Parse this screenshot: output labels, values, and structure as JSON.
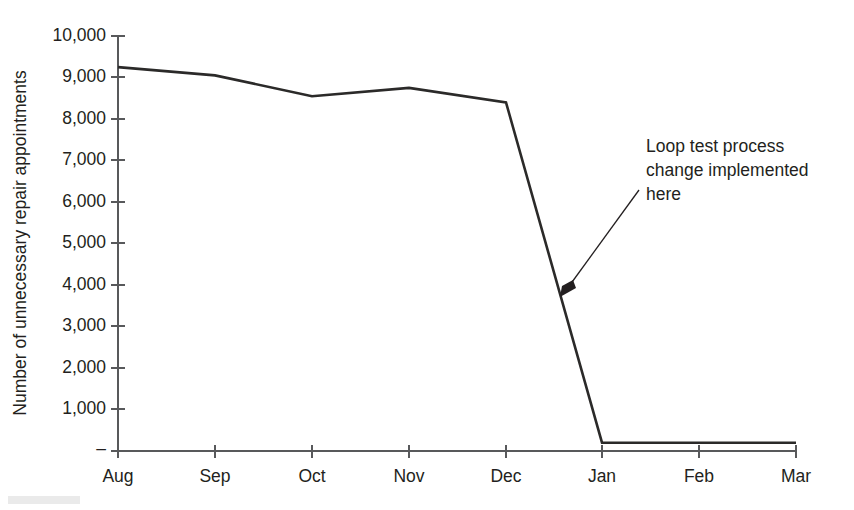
{
  "chart_data": {
    "type": "line",
    "title": "",
    "xlabel": "",
    "ylabel": "Number of unnecessary repair appointments",
    "categories": [
      "Aug",
      "Sep",
      "Oct",
      "Nov",
      "Dec",
      "Jan",
      "Feb",
      "Mar"
    ],
    "values": [
      9250,
      9050,
      8550,
      8750,
      8400,
      200,
      200,
      200
    ],
    "series": [
      {
        "name": "Unnecessary repair appointments",
        "values": [
          9250,
          9050,
          8550,
          8750,
          8400,
          200,
          200,
          200
        ],
        "color": "#2b2a29"
      }
    ],
    "ylim": [
      0,
      10000
    ],
    "ytick_values": [
      0,
      1000,
      2000,
      3000,
      4000,
      5000,
      6000,
      7000,
      8000,
      9000,
      10000
    ],
    "ytick_labels": [
      "–",
      "1,000",
      "2,000",
      "3,000",
      "4,000",
      "5,000",
      "6,000",
      "7,000",
      "8,000",
      "9,000",
      "10,000"
    ],
    "grid": false,
    "legend": false,
    "legend_position": "none",
    "annotations": [
      {
        "text_lines": [
          "Loop test process",
          "change implemented",
          "here"
        ],
        "text_x": 646,
        "text_y": 152,
        "arrow_from_x": 639,
        "arrow_from_y": 190,
        "arrow_to_x": 562,
        "arrow_to_y": 296,
        "points_to_category": "between Dec and Jan"
      }
    ],
    "colors": {
      "series": "#2b2a29",
      "axis": "#58595b",
      "text": "#231f20",
      "background": "#ffffff"
    }
  },
  "axes": {
    "x_positions": [
      118,
      215,
      312,
      409,
      506,
      602,
      699,
      796
    ],
    "y_top_px": 36,
    "y_bottom_px": 451,
    "x_left_px": 118,
    "x_right_px": 797
  }
}
